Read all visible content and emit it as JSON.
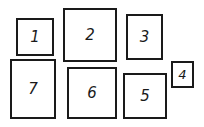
{
  "diagram": {
    "boxes": [
      {
        "label": "1"
      },
      {
        "label": "2"
      },
      {
        "label": "3"
      },
      {
        "label": "4"
      },
      {
        "label": "5"
      },
      {
        "label": "6"
      },
      {
        "label": "7"
      }
    ]
  }
}
